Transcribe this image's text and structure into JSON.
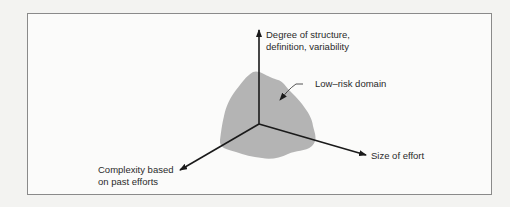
{
  "diagram": {
    "type": "3d-axes-with-region",
    "axes": {
      "vertical": {
        "label_line1": "Degree of structure,",
        "label_line2": "definition, variability"
      },
      "left_diagonal": {
        "label_line1": "Complexity based",
        "label_line2": "on past efforts"
      },
      "right_diagonal": {
        "label": "Size of effort"
      }
    },
    "region": {
      "label": "Low–risk domain",
      "fill_color": "#b4b4b4"
    },
    "colors": {
      "axis": "#1a1a1a",
      "frame_border": "#8a8a8a",
      "background": "#fbfbfa",
      "text": "#2a2a2a"
    }
  }
}
